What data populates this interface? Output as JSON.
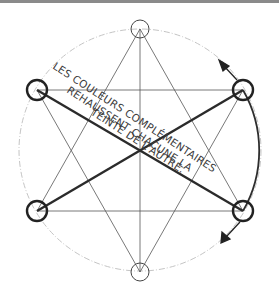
{
  "diagram": {
    "type": "color-wheel-complementary-star",
    "colors": {
      "ink": "#333333",
      "thin_line": "#555555",
      "wheel_faint": "#bbbbbb",
      "topbar": "#8a8a8a",
      "background": "#ffffff"
    },
    "wheel": {
      "cx": 140,
      "cy": 150,
      "r": 121
    },
    "nodes": [
      {
        "id": "top",
        "x": 140,
        "y": 29,
        "r": 9,
        "emphasis": false
      },
      {
        "id": "upper-right",
        "x": 243,
        "y": 90,
        "r": 10,
        "emphasis": true
      },
      {
        "id": "lower-right",
        "x": 243,
        "y": 211,
        "r": 10,
        "emphasis": true
      },
      {
        "id": "bottom",
        "x": 140,
        "y": 272,
        "r": 9,
        "emphasis": false
      },
      {
        "id": "lower-left",
        "x": 37,
        "y": 211,
        "r": 10,
        "emphasis": true
      },
      {
        "id": "upper-left",
        "x": 37,
        "y": 90,
        "r": 10,
        "emphasis": true
      }
    ],
    "thick_links": [
      [
        "upper-left",
        "lower-right"
      ],
      [
        "upper-right",
        "lower-left"
      ]
    ],
    "arrows": [
      {
        "from": [
          237,
          80
        ],
        "to": [
          221,
          63
        ],
        "label": "rotation-arrow-top"
      },
      {
        "from": [
          240,
          222
        ],
        "to": [
          222,
          242
        ],
        "label": "rotation-arrow-bottom"
      }
    ],
    "caption_lines": [
      "LES COULEURS COMPLÉMENTAIRES",
      "REHAUSSENT CHACUNE LA",
      "TEINTE DE L'AUTRE."
    ]
  }
}
